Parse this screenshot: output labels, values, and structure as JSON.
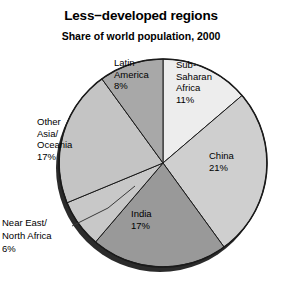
{
  "chart_data": {
    "type": "pie",
    "title": "Less−developed regions",
    "subtitle": "Share of world population, 2000",
    "xlabel": "",
    "ylabel": "",
    "grid": false,
    "legend_position": "none",
    "labels_inside": true,
    "value_unit": "%",
    "categories": [
      "Sub-Saharan Africa",
      "China",
      "India",
      "Near East/North Africa",
      "Other Asia/Oceania",
      "Latin America"
    ],
    "values": [
      11,
      21,
      17,
      6,
      17,
      8
    ],
    "slices": [
      {
        "name": "Sub-Saharan Africa",
        "label_lines": [
          "Sub-",
          "Saharan",
          "Africa",
          "11%"
        ],
        "value": 11,
        "value_label": "11%",
        "color": "#ededed",
        "label_placement": "inside"
      },
      {
        "name": "China",
        "label_lines": [
          "China",
          "21%"
        ],
        "value": 21,
        "value_label": "21%",
        "color": "#cfcfcf",
        "label_placement": "inside"
      },
      {
        "name": "India",
        "label_lines": [
          "India",
          "17%"
        ],
        "value": 17,
        "value_label": "17%",
        "color": "#999999",
        "label_placement": "inside"
      },
      {
        "name": "Near East/North Africa",
        "label_lines": [
          "Near East/",
          "North Africa",
          "6%"
        ],
        "value": 6,
        "value_label": "6%",
        "color": "#c8c8c8",
        "label_placement": "outside",
        "leader_line": true
      },
      {
        "name": "Other Asia/Oceania",
        "label_lines": [
          "Other",
          "Asia/",
          "Oceania",
          "17%"
        ],
        "value": 17,
        "value_label": "17%",
        "color": "#c4c4c4",
        "label_placement": "inside"
      },
      {
        "name": "Latin America",
        "label_lines": [
          "Latin",
          "America",
          "8%"
        ],
        "value": 8,
        "value_label": "8%",
        "color": "#a8a8a8",
        "label_placement": "inside"
      }
    ],
    "geometry": {
      "center_x": 163,
      "center_y": 163,
      "radius": 104,
      "start_angle_deg": 0,
      "direction": "clockwise"
    },
    "colors": {
      "background": "#ffffff",
      "outline": "#1a1a1a",
      "shadow_rim": "#2b2b2b",
      "text": "#000000"
    }
  }
}
